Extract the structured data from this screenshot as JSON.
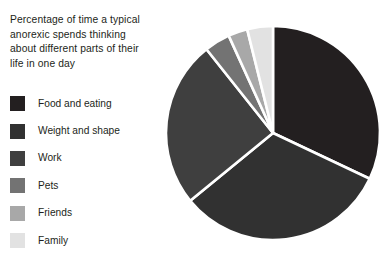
{
  "chart_data": {
    "type": "pie",
    "title": "Percentage of time a typical anorexic spends thinking about different parts of their life in one day",
    "categories": [
      "Food and eating",
      "Weight and shape",
      "Work",
      "Pets",
      "Friends",
      "Family"
    ],
    "values": [
      33,
      33,
      26,
      4,
      3,
      4
    ],
    "unit": "%",
    "colors": [
      "#231f20",
      "#313131",
      "#3f3f3f",
      "#737373",
      "#a8a8a8",
      "#e2e2e2"
    ],
    "legend_position": "left",
    "start_angle_deg": 0,
    "direction": "clockwise",
    "slice_gap": true,
    "grid": false,
    "xlabel": "",
    "ylabel": ""
  },
  "title": {
    "text": "Percentage of time a typical\nanorexic spends thinking\nabout different parts of their\nlife in one day"
  },
  "legend": {
    "items": [
      {
        "label": "Food and eating",
        "color": "#231f20",
        "value": 33
      },
      {
        "label": "Weight and shape",
        "color": "#313131",
        "value": 33
      },
      {
        "label": "Work",
        "color": "#3f3f3f",
        "value": 26
      },
      {
        "label": "Pets",
        "color": "#737373",
        "value": 4
      },
      {
        "label": "Friends",
        "color": "#a8a8a8",
        "value": 3
      },
      {
        "label": "Family",
        "color": "#e2e2e2",
        "value": 4
      }
    ]
  },
  "pie": {
    "center_x": 113,
    "center_y": 113,
    "radius": 107,
    "background": "#ffffff"
  }
}
